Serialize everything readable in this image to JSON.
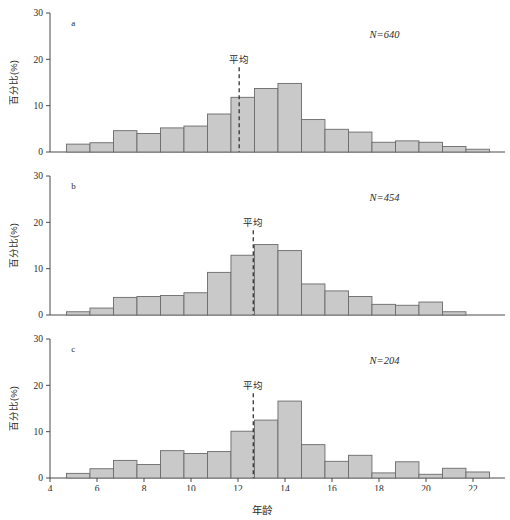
{
  "figure": {
    "width": 510,
    "height": 513,
    "background": "#ffffff",
    "bar_fill": "#c9c9c9",
    "bar_stroke": "#6a6a6a",
    "axis_color": "#4a4a4a",
    "mean_line_color": "#333333",
    "x_axis_title": "年龄",
    "y_axis_title": "百分比(%)",
    "mean_marker_label": "平均"
  },
  "chart_data": [
    {
      "type": "bar",
      "panel": "a",
      "title": "",
      "xlabel": "年龄",
      "ylabel": "百分比(%)",
      "xlim": [
        3.5,
        24.5
      ],
      "ylim": [
        0,
        30
      ],
      "xticks": [
        4,
        6,
        8,
        10,
        12,
        14,
        16,
        18,
        20,
        22
      ],
      "yticks": [
        0,
        10,
        20,
        30
      ],
      "grid": false,
      "legend": "none",
      "annotations": [
        {
          "text": "a",
          "x": 4.7,
          "y": 28
        },
        {
          "text": "N=640",
          "x": 18.2,
          "y": 25.5
        },
        {
          "text": "平均",
          "x": 12.05,
          "y": 19.5
        }
      ],
      "sample_size_label": "N=640",
      "sample_size": 640,
      "mean_x": 12.05,
      "bin_width": 1,
      "bin_starts": [
        4.7,
        5.7,
        6.7,
        7.7,
        8.7,
        9.7,
        10.7,
        11.7,
        12.7,
        13.7,
        14.7,
        15.7,
        16.7,
        17.7,
        18.7,
        19.7,
        20.7,
        21.7
      ],
      "categories": [
        "4.7-5.7",
        "5.7-6.7",
        "6.7-7.7",
        "7.7-8.7",
        "8.7-9.7",
        "9.7-10.7",
        "10.7-11.7",
        "11.7-12.7",
        "12.7-13.7",
        "13.7-14.7",
        "14.7-15.7",
        "15.7-16.7",
        "16.7-17.7",
        "17.7-18.7",
        "18.7-19.7",
        "19.7-20.7",
        "20.7-21.7",
        "21.7-22.7"
      ],
      "values": [
        1.7,
        2.0,
        4.6,
        4.0,
        5.2,
        5.6,
        8.2,
        11.8,
        13.7,
        14.8,
        7.0,
        4.9,
        4.3,
        2.1,
        2.4,
        2.1,
        1.2,
        0.6
      ]
    },
    {
      "type": "bar",
      "panel": "b",
      "title": "",
      "xlabel": "年龄",
      "ylabel": "百分比(%)",
      "xlim": [
        3.5,
        24.5
      ],
      "ylim": [
        0,
        30
      ],
      "xticks": [
        4,
        6,
        8,
        10,
        12,
        14,
        16,
        18,
        20,
        22
      ],
      "yticks": [
        0,
        10,
        20,
        30
      ],
      "grid": false,
      "legend": "none",
      "annotations": [
        {
          "text": "b",
          "x": 4.7,
          "y": 28
        },
        {
          "text": "N=454",
          "x": 18.2,
          "y": 25.5
        },
        {
          "text": "平均",
          "x": 12.65,
          "y": 19.5
        }
      ],
      "sample_size_label": "N=454",
      "sample_size": 454,
      "mean_x": 12.65,
      "bin_width": 1,
      "bin_starts": [
        4.7,
        5.7,
        6.7,
        7.7,
        8.7,
        9.7,
        10.7,
        11.7,
        12.7,
        13.7,
        14.7,
        15.7,
        16.7,
        17.7,
        18.7,
        19.7,
        20.7,
        21.7
      ],
      "categories": [
        "4.7-5.7",
        "5.7-6.7",
        "6.7-7.7",
        "7.7-8.7",
        "8.7-9.7",
        "9.7-10.7",
        "10.7-11.7",
        "11.7-12.7",
        "12.7-13.7",
        "13.7-14.7",
        "14.7-15.7",
        "15.7-16.7",
        "16.7-17.7",
        "17.7-18.7",
        "18.7-19.7",
        "19.7-20.7",
        "20.7-21.7",
        "21.7-22.7"
      ],
      "values": [
        0.7,
        1.5,
        3.8,
        4.0,
        4.2,
        4.8,
        9.2,
        12.9,
        15.2,
        13.9,
        6.7,
        5.2,
        4.0,
        2.3,
        2.1,
        2.8,
        0.7,
        0.0
      ]
    },
    {
      "type": "bar",
      "panel": "c",
      "title": "",
      "xlabel": "年龄",
      "ylabel": "百分比(%)",
      "xlim": [
        3.5,
        24.5
      ],
      "ylim": [
        0,
        30
      ],
      "xticks": [
        4,
        6,
        8,
        10,
        12,
        14,
        16,
        18,
        20,
        22
      ],
      "yticks": [
        0,
        10,
        20,
        30
      ],
      "grid": false,
      "legend": "none",
      "annotations": [
        {
          "text": "c",
          "x": 4.7,
          "y": 28
        },
        {
          "text": "N=204",
          "x": 18.2,
          "y": 25.5
        },
        {
          "text": "平均",
          "x": 12.65,
          "y": 19.5
        }
      ],
      "sample_size_label": "N=204",
      "sample_size": 204,
      "mean_x": 12.65,
      "bin_width": 1,
      "bin_starts": [
        4.7,
        5.7,
        6.7,
        7.7,
        8.7,
        9.7,
        10.7,
        11.7,
        12.7,
        13.7,
        14.7,
        15.7,
        16.7,
        17.7,
        18.7,
        19.7,
        20.7,
        21.7
      ],
      "categories": [
        "4.7-5.7",
        "5.7-6.7",
        "6.7-7.7",
        "7.7-8.7",
        "8.7-9.7",
        "9.7-10.7",
        "10.7-11.7",
        "11.7-12.7",
        "12.7-13.7",
        "13.7-14.7",
        "14.7-15.7",
        "15.7-16.7",
        "16.7-17.7",
        "17.7-18.7",
        "18.7-19.7",
        "19.7-20.7",
        "20.7-21.7",
        "21.7-22.7"
      ],
      "values": [
        1.0,
        2.0,
        3.8,
        2.9,
        5.9,
        5.3,
        5.7,
        10.1,
        12.5,
        16.6,
        7.2,
        3.6,
        4.9,
        1.1,
        3.5,
        0.8,
        2.1,
        1.3
      ]
    }
  ]
}
